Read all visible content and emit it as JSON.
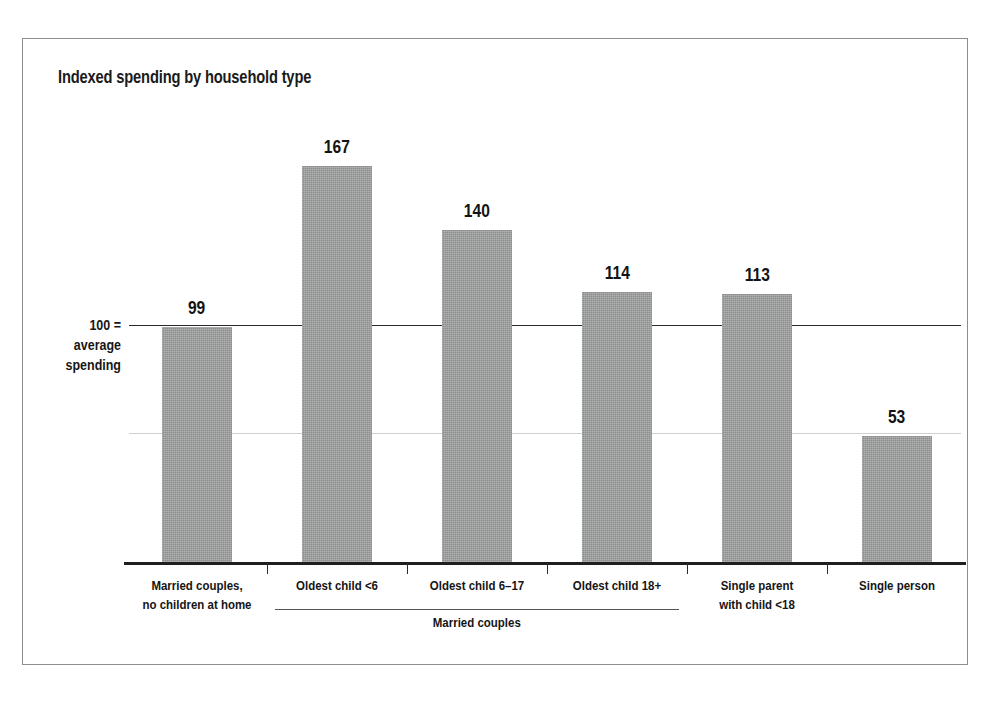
{
  "chart_data": {
    "type": "bar",
    "title": "Indexed spending by household type",
    "xlabel": "",
    "ylabel": "",
    "reference_line": {
      "value": 100,
      "label_lines": [
        "100 =",
        "average",
        "spending"
      ]
    },
    "ylim": [
      0,
      175
    ],
    "grid": false,
    "legend": "none",
    "categories": [
      "Married couples, no children at home",
      "Oldest child <6",
      "Oldest child 6–17",
      "Oldest child 18+",
      "Single parent with child <18",
      "Single person"
    ],
    "category_label_lines": [
      [
        "Married couples,",
        "no children at home"
      ],
      [
        "Oldest child <6"
      ],
      [
        "Oldest child 6–17"
      ],
      [
        "Oldest child 18+"
      ],
      [
        "Single parent",
        "with child <18"
      ],
      [
        "Single person"
      ]
    ],
    "values": [
      99,
      167,
      140,
      114,
      113,
      53
    ],
    "value_labels": [
      "99",
      "167",
      "140",
      "114",
      "113",
      "53"
    ],
    "groups": [
      {
        "label": "Married couples",
        "member_indices": [
          1,
          2,
          3
        ]
      }
    ],
    "colors": {
      "bar_fill": "#9a9b9b",
      "baseline": "#1f1f1f",
      "reference_line": "#2a2a2a",
      "text": "#151515",
      "frame_border": "#8d8d8d",
      "background": "#ffffff"
    }
  }
}
